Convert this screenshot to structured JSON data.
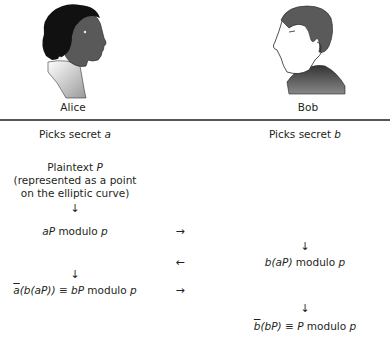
{
  "participants": {
    "alice": {
      "name": "Alice",
      "portrait": "alice-portrait-icon"
    },
    "bob": {
      "name": "Bob",
      "portrait": "bob-portrait-icon"
    }
  },
  "alice_steps": {
    "picks_prefix": "Picks secret ",
    "picks_var": "a",
    "plaintext_prefix": "Plaintext ",
    "plaintext_var": "P",
    "plaintext_note_1": "(represented as a point",
    "plaintext_note_2": "on the elliptic curve)",
    "arrow_down_1": "↓",
    "step1_var": "aP",
    "step1_suffix": " modulo ",
    "step1_mod": "p",
    "arrow_down_2": "↓",
    "step3_abar": "a",
    "step3_inner": "(b(aP)) ≡ ",
    "step3_var": "bP",
    "step3_suffix": " modulo ",
    "step3_mod": "p"
  },
  "bob_steps": {
    "picks_prefix": "Picks secret ",
    "picks_var": "b",
    "arrow_down_1": "↓",
    "step2_b": "b",
    "step2_inner": "(aP)",
    "step2_suffix": " modulo ",
    "step2_mod": "p",
    "arrow_down_2": "↓",
    "step4_bbar": "b",
    "step4_inner": "(bP) ≡ ",
    "step4_var": "P",
    "step4_suffix": " modulo ",
    "step4_mod": "p"
  },
  "channel": {
    "arrow_1": "→",
    "arrow_2": "←",
    "arrow_3": "→"
  }
}
